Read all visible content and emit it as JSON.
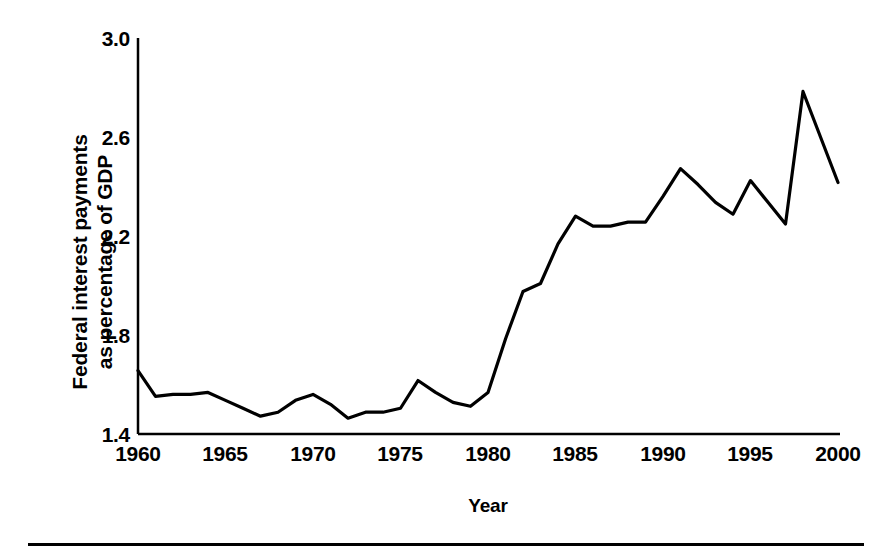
{
  "figure": {
    "background_color": "#ffffff",
    "line_color": "#000000",
    "axis_color": "#000000",
    "footer_rule": "horizontal-rule"
  },
  "chart_data": {
    "type": "line",
    "title": "",
    "xlabel": "Year",
    "ylabel": "Federal interest payments\nas percentage of GDP",
    "ylabel_line1": "Federal interest payments",
    "ylabel_line2": "as percentage of GDP",
    "xlim": [
      1960,
      2000
    ],
    "ylim": [
      1.0,
      3.0
    ],
    "yticks": [
      "3.0",
      "2.6",
      "2.2",
      "1.8",
      "1.4",
      "1.0"
    ],
    "ytick_values": [
      3.0,
      2.6,
      2.2,
      1.8,
      1.4,
      1.0
    ],
    "xticks": [
      "1960",
      "1965",
      "1970",
      "1975",
      "1980",
      "1985",
      "1990",
      "1995",
      "2000"
    ],
    "xtick_values": [
      1960,
      1965,
      1970,
      1975,
      1980,
      1985,
      1990,
      1995,
      2000
    ],
    "grid": false,
    "legend": null,
    "series": [
      {
        "name": "Federal interest payments as percentage of GDP",
        "color": "#000000",
        "x": [
          1960,
          1961,
          1962,
          1963,
          1964,
          1965,
          1966,
          1967,
          1968,
          1969,
          1970,
          1971,
          1972,
          1973,
          1974,
          1975,
          1976,
          1977,
          1978,
          1979,
          1980,
          1981,
          1982,
          1983,
          1984,
          1985,
          1986,
          1987,
          1988,
          1989,
          1990,
          1991,
          1992,
          1993,
          1994,
          1995,
          1996,
          1997,
          1998,
          1999,
          2000
        ],
        "values": [
          1.32,
          1.19,
          1.2,
          1.2,
          1.21,
          1.17,
          1.13,
          1.09,
          1.11,
          1.17,
          1.2,
          1.15,
          1.08,
          1.11,
          1.11,
          1.13,
          1.27,
          1.21,
          1.16,
          1.14,
          1.21,
          1.48,
          1.72,
          1.76,
          1.96,
          2.1,
          2.05,
          2.05,
          2.07,
          2.07,
          2.2,
          2.34,
          2.26,
          2.17,
          2.11,
          2.28,
          2.17,
          2.06,
          2.73,
          2.5,
          2.27
        ]
      }
    ]
  }
}
